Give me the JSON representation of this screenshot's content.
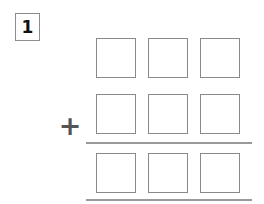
{
  "worksheet": {
    "problem_number": "1",
    "operator": "+",
    "layout": {
      "columns": 3,
      "rows": 3,
      "cell_size_px": 40
    },
    "rows": [
      {
        "name": "addend-row-1",
        "role": "addend",
        "top_px": 38,
        "cells": [
          {
            "name": "cell-r1-c1",
            "value": "",
            "left_px": 96
          },
          {
            "name": "cell-r1-c2",
            "value": "",
            "left_px": 148
          },
          {
            "name": "cell-r1-c3",
            "value": "",
            "left_px": 200
          }
        ]
      },
      {
        "name": "addend-row-2",
        "role": "addend",
        "top_px": 94,
        "cells": [
          {
            "name": "cell-r2-c1",
            "value": "",
            "left_px": 96
          },
          {
            "name": "cell-r2-c2",
            "value": "",
            "left_px": 148
          },
          {
            "name": "cell-r2-c3",
            "value": "",
            "left_px": 200
          }
        ]
      },
      {
        "name": "sum-row",
        "role": "sum",
        "top_px": 153,
        "cells": [
          {
            "name": "cell-r3-c1",
            "value": "",
            "left_px": 96
          },
          {
            "name": "cell-r3-c2",
            "value": "",
            "left_px": 148
          },
          {
            "name": "cell-r3-c3",
            "value": "",
            "left_px": 200
          }
        ]
      }
    ],
    "rules": [
      {
        "name": "sum-rule",
        "top_px": 142,
        "left_px": 86,
        "width_px": 166
      },
      {
        "name": "bottom-rule",
        "top_px": 199,
        "left_px": 86,
        "width_px": 166
      }
    ],
    "colors": {
      "page_background": "#ffffff",
      "cell_border": "#8a8a8a",
      "rule": "#9a9a9a",
      "number_text": "#111111",
      "operator": "#555555",
      "badge_border": "#8d8d8d"
    }
  }
}
